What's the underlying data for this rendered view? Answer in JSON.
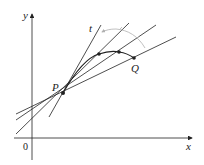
{
  "diagram": {
    "type": "tangent-secant-limit",
    "axes": {
      "x_label": "x",
      "y_label": "y",
      "origin_label": "0"
    },
    "points": {
      "P": {
        "label": "P",
        "x": 63,
        "y": 93
      },
      "Q": {
        "label": "Q",
        "x": 134,
        "y": 58
      },
      "intermediate": [
        {
          "x": 99,
          "y": 54
        },
        {
          "x": 119,
          "y": 52
        }
      ]
    },
    "tangent_line": {
      "label": "t"
    },
    "secant_lines_count": 3,
    "colors": {
      "line": "#222222",
      "arc": "#b0b0b0",
      "background": "#ffffff"
    }
  }
}
